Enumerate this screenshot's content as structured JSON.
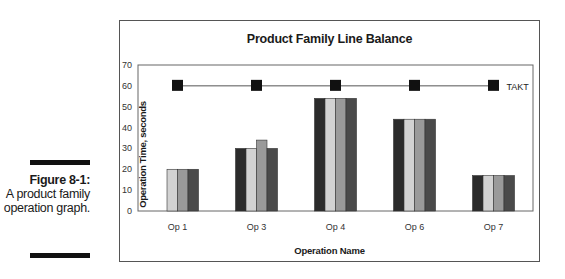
{
  "figure": {
    "number_label": "Figure 8-1:",
    "description": "A product family operation graph."
  },
  "chart_data": {
    "type": "bar",
    "title": "Product Family Line Balance",
    "xlabel": "Operation Name",
    "ylabel": "Operation Time, seconds",
    "ylim": [
      0,
      70
    ],
    "yticks": [
      0,
      10,
      20,
      30,
      40,
      50,
      60,
      70
    ],
    "grid": false,
    "categories": [
      "Op 1",
      "Op 3",
      "Op 4",
      "Op 6",
      "Op 7"
    ],
    "series": [
      {
        "name": "Product A",
        "color": "#2b2b2b",
        "values": [
          0,
          30,
          54,
          44,
          17
        ]
      },
      {
        "name": "Product B",
        "color": "#d2d2d2",
        "values": [
          20,
          30,
          54,
          44,
          17
        ]
      },
      {
        "name": "Product C",
        "color": "#9a9a9a",
        "values": [
          20,
          34,
          54,
          44,
          17
        ]
      },
      {
        "name": "Product D",
        "color": "#4a4a4a",
        "values": [
          20,
          30,
          54,
          44,
          17
        ]
      }
    ],
    "reference_line": {
      "name": "TAKT",
      "value": 60,
      "marker": "square",
      "color": "#111111"
    },
    "legend": {
      "position": "right",
      "entries": [
        "TAKT"
      ]
    }
  }
}
